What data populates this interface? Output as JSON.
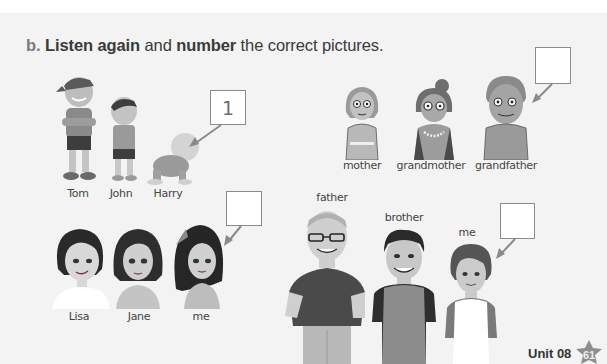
{
  "page": {
    "instruction": {
      "letter": "b.",
      "part1_bold": "Listen again",
      "part2": " and ",
      "part3_bold": "number",
      "part4": " the correct pictures."
    },
    "groups": [
      {
        "id": "brothers",
        "labels": [
          "Tom",
          "John",
          "Harry"
        ],
        "answer_box": "1"
      },
      {
        "id": "grandparents",
        "labels": [
          "mother",
          "grandmother",
          "grandfather"
        ],
        "answer_box": ""
      },
      {
        "id": "girls",
        "labels": [
          "Lisa",
          "Jane",
          "me"
        ],
        "answer_box": ""
      },
      {
        "id": "boys",
        "labels": [
          "father",
          "brother",
          "me"
        ],
        "answer_box": ""
      }
    ],
    "footer": {
      "unit": "Unit 08",
      "page_number": "61"
    }
  }
}
